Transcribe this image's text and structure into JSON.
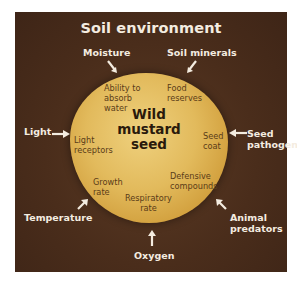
{
  "diagram": {
    "title": "Soil environment",
    "center": {
      "label": "Wild\nmustard\nseed"
    },
    "seed_traits": [
      {
        "id": "absorb",
        "label": "Ability to\nabsorb\nwater"
      },
      {
        "id": "food",
        "label": "Food\nreserves"
      },
      {
        "id": "light-receptors",
        "label": "Light\nreceptors"
      },
      {
        "id": "seed-coat",
        "label": "Seed\ncoat"
      },
      {
        "id": "growth",
        "label": "Growth\nrate"
      },
      {
        "id": "defensive",
        "label": "Defensive\ncompounds"
      },
      {
        "id": "respiratory",
        "label": "Respiratory\nrate"
      }
    ],
    "environment_factors": [
      {
        "id": "moisture",
        "label": "Moisture"
      },
      {
        "id": "soil-minerals",
        "label": "Soil minerals"
      },
      {
        "id": "light",
        "label": "Light"
      },
      {
        "id": "seed-pathogens",
        "label": "Seed\npathogens"
      },
      {
        "id": "temperature",
        "label": "Temperature"
      },
      {
        "id": "animal-predators",
        "label": "Animal\npredators"
      },
      {
        "id": "oxygen",
        "label": "Oxygen"
      }
    ],
    "colors": {
      "background": "#4a2d1b",
      "seed_light": "#efd17e",
      "seed_dark": "#b9822a",
      "factor_text": "#f4ece0",
      "trait_text": "#5a3c18"
    }
  }
}
